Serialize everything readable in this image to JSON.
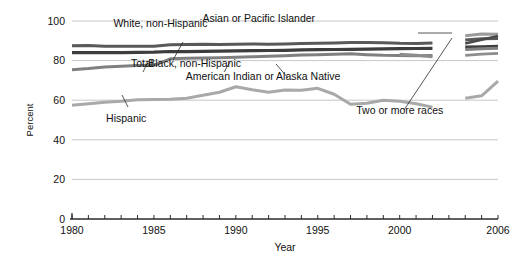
{
  "chart_data": {
    "type": "line",
    "title": "",
    "xlabel": "Year",
    "ylabel": "Percent",
    "xlim": [
      1980,
      2006
    ],
    "ylim": [
      0,
      100
    ],
    "ytick_values": [
      0,
      20,
      40,
      60,
      80,
      100
    ],
    "ytick_labels": [
      "0",
      "20",
      "40",
      "60",
      "80",
      "100"
    ],
    "xtick_labels": [
      "1980",
      "1985",
      "1990",
      "1995",
      "2000",
      "2006"
    ],
    "xtick_label_years": [
      1980,
      1985,
      1990,
      1995,
      2000,
      2006
    ],
    "minor_tick_interval": 1,
    "grid": "horizontal",
    "legend": "inline-annotations",
    "data_break_years": [
      2002,
      2003
    ],
    "x": [
      1980,
      1981,
      1982,
      1983,
      1984,
      1985,
      1986,
      1987,
      1988,
      1989,
      1990,
      1991,
      1992,
      1993,
      1994,
      1995,
      1996,
      1997,
      1998,
      1999,
      2000,
      2001,
      2002,
      2003,
      2004,
      2005,
      2006
    ],
    "series": [
      {
        "name": "Asian or Pacific Islander",
        "color": "#9b9b9b",
        "width": 3.0,
        "label_x_pct": 49.2,
        "label_y_pct": 8.5,
        "values": [
          null,
          null,
          null,
          null,
          null,
          null,
          null,
          null,
          null,
          null,
          null,
          null,
          null,
          null,
          null,
          null,
          null,
          null,
          null,
          null,
          null,
          null,
          93.0,
          null,
          92.6,
          93.4,
          93.3
        ]
      },
      {
        "name": "White, non-Hispanic",
        "color": "#595959",
        "width": 3.0,
        "label_x_pct": 30.5,
        "label_y_pct": 10.5,
        "values": [
          87.5,
          87.6,
          87.3,
          87.2,
          87.2,
          87.3,
          88.0,
          88.1,
          88.3,
          88.1,
          88.2,
          88.4,
          88.3,
          88.4,
          88.6,
          88.8,
          88.9,
          89.1,
          89.2,
          89.0,
          88.7,
          88.6,
          88.9,
          null,
          90.4,
          91.0,
          91.2
        ]
      },
      {
        "name": "Total",
        "color": "#3d3d3d",
        "width": 3.2,
        "label_x_pct": 27.0,
        "label_y_pct": 26.0,
        "values": [
          84.0,
          84.0,
          84.1,
          84.0,
          84.2,
          84.3,
          84.6,
          84.5,
          84.7,
          84.8,
          84.9,
          85.0,
          85.1,
          85.2,
          85.4,
          85.5,
          85.6,
          85.7,
          85.8,
          85.9,
          86.0,
          86.1,
          86.2,
          null,
          86.8,
          87.0,
          87.2
        ]
      },
      {
        "name": "Black, non-Hispanic",
        "color": "#808080",
        "width": 3.0,
        "label_x_pct": 37.0,
        "label_y_pct": 26.0,
        "values": [
          75.4,
          76.0,
          76.8,
          77.2,
          77.5,
          77.6,
          80.9,
          81.2,
          81.3,
          81.5,
          81.7,
          81.9,
          82.2,
          82.5,
          82.8,
          83.0,
          83.2,
          83.4,
          83.0,
          82.7,
          82.6,
          82.4,
          82.6,
          null,
          85.6,
          86.0,
          86.2
        ]
      },
      {
        "name": "American Indian or Alaska Native",
        "color": "#8d8d8d",
        "width": 2.8,
        "label_x_pct": 50.0,
        "label_y_pct": 31.0,
        "values": [
          null,
          null,
          null,
          null,
          null,
          null,
          null,
          null,
          null,
          null,
          null,
          null,
          null,
          null,
          null,
          null,
          null,
          null,
          null,
          null,
          83.2,
          82.7,
          81.9,
          null,
          82.6,
          83.3,
          83.6
        ]
      },
      {
        "name": "Two or more races",
        "color": "#4a4a4a",
        "width": 2.6,
        "label_x_pct": 76.0,
        "label_y_pct": 44.0,
        "values": [
          null,
          null,
          null,
          null,
          null,
          null,
          null,
          null,
          null,
          null,
          null,
          null,
          null,
          null,
          null,
          null,
          null,
          null,
          null,
          null,
          null,
          null,
          null,
          null,
          88.6,
          90.5,
          92.4
        ]
      },
      {
        "name": "Hispanic",
        "color": "#a9a9a9",
        "width": 3.0,
        "label_x_pct": 24.0,
        "label_y_pct": 47.0,
        "values": [
          57.5,
          58.2,
          59.0,
          59.5,
          60.2,
          60.3,
          60.5,
          61.0,
          62.5,
          64.0,
          66.8,
          65.3,
          64.0,
          65.2,
          65.0,
          66.0,
          63.0,
          58.0,
          58.5,
          60.0,
          59.5,
          58.2,
          56.5,
          null,
          61.0,
          62.2,
          69.6
        ]
      }
    ]
  },
  "annotations": {
    "asian_label": "Asian or Pacific Islander",
    "white_label": "White, non-Hispanic",
    "total_label": "Total",
    "black_label": "Black, non-Hispanic",
    "amind_label": "American Indian or Alaska Native",
    "tworaces_label": "Two or more races",
    "hispanic_label": "Hispanic"
  }
}
